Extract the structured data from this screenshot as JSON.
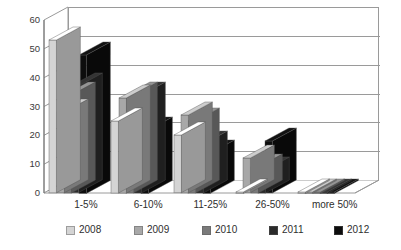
{
  "chart_data": {
    "type": "bar",
    "title": "",
    "subtitle": "",
    "xlabel": "",
    "ylabel": "",
    "ylim": [
      0,
      60
    ],
    "yticks": [
      0,
      10,
      20,
      30,
      40,
      50,
      60
    ],
    "grid": true,
    "legend_position": "bottom",
    "style": "3d-clustered-column",
    "categories": [
      "1-5%",
      "6-10%",
      "11-25%",
      "26-50%",
      "more 50%"
    ],
    "series": [
      {
        "name": "2008",
        "color": "#d4d4d4",
        "values": [
          53,
          25,
          20,
          0,
          0
        ]
      },
      {
        "name": "2009",
        "color": "#a8a8a8",
        "values": [
          28,
          33,
          27,
          12,
          0
        ]
      },
      {
        "name": "2010",
        "color": "#7a7a7a",
        "values": [
          34,
          34,
          25,
          9,
          0
        ]
      },
      {
        "name": "2011",
        "color": "#2b2b2b",
        "values": [
          37,
          34,
          17,
          8,
          0
        ]
      },
      {
        "name": "2012",
        "color": "#0d0d0d",
        "values": [
          48,
          22,
          14,
          18,
          0
        ]
      }
    ]
  },
  "legend": {
    "items": [
      {
        "label": "2008"
      },
      {
        "label": "2009"
      },
      {
        "label": "2010"
      },
      {
        "label": "2011"
      },
      {
        "label": "2012"
      }
    ]
  },
  "axis": {
    "y_tick_labels": [
      "60",
      "50",
      "40",
      "30",
      "20",
      "10",
      "0"
    ]
  }
}
